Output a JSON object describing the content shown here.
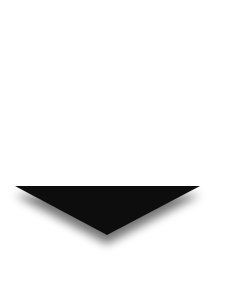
{
  "icon": {
    "name": "down-triangle-arrow",
    "fill_color": "#111111",
    "shadow_color": "#555555",
    "background_color": "#ffffff",
    "points": {
      "left": [
        15,
        186
      ],
      "right": [
        200,
        186
      ],
      "apex": [
        107,
        235
      ]
    }
  }
}
